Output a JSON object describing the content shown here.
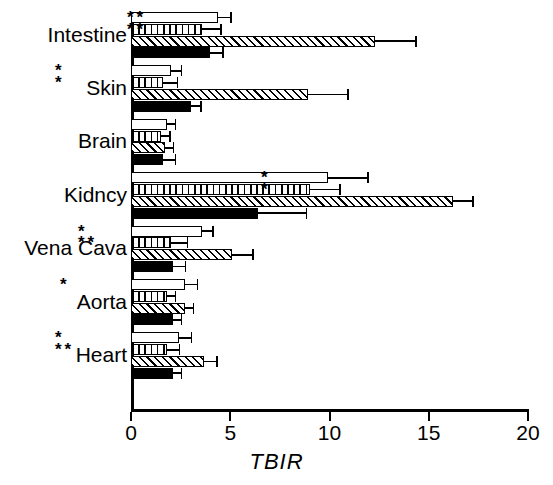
{
  "chart_data": {
    "type": "bar",
    "orientation": "horizontal",
    "title": "",
    "xlabel": "TBIR",
    "ylabel": "",
    "xlim": [
      0,
      20
    ],
    "xticks": [
      0,
      5,
      10,
      15,
      20
    ],
    "xticklabels": [
      "0",
      "5",
      "10",
      "15",
      "20"
    ],
    "grid": false,
    "legend": "none",
    "categories": [
      "Intestine",
      "Skin",
      "Brain",
      "Kidncy",
      "Vena Cava",
      "Aorta",
      "Heart"
    ],
    "series": [
      {
        "name": "open",
        "fill": "white",
        "values": [
          4.4,
          2.0,
          1.8,
          9.9,
          3.6,
          2.7,
          2.4
        ],
        "errors": [
          0.6,
          0.5,
          0.4,
          2.0,
          0.5,
          0.6,
          0.6
        ],
        "significance": [
          "",
          "*",
          "",
          "*",
          "*",
          "*",
          "*"
        ]
      },
      {
        "name": "vertical-striped",
        "fill": "vertical-stripes",
        "values": [
          3.6,
          1.6,
          1.5,
          9.0,
          2.0,
          1.8,
          1.8
        ],
        "errors": [
          0.9,
          0.7,
          0.4,
          1.5,
          0.8,
          0.4,
          0.6
        ],
        "significance": [
          "",
          "",
          "",
          "",
          "",
          "",
          ""
        ]
      },
      {
        "name": "diagonal-hatched",
        "fill": "diagonal-hatch",
        "values": [
          12.3,
          8.9,
          1.7,
          16.2,
          5.1,
          2.7,
          3.7
        ],
        "errors": [
          2.0,
          2.0,
          0.4,
          1.0,
          1.0,
          0.4,
          0.6
        ],
        "significance": [
          "**",
          "*",
          "",
          "*",
          "**",
          "",
          "**"
        ]
      },
      {
        "name": "solid-black",
        "fill": "black",
        "values": [
          4.0,
          3.0,
          1.6,
          6.4,
          2.1,
          2.1,
          2.1
        ],
        "errors": [
          0.6,
          0.5,
          0.6,
          2.4,
          0.6,
          0.4,
          0.4
        ],
        "significance": [
          "",
          "",
          "",
          "",
          "",
          "",
          ""
        ]
      }
    ],
    "annotations": [
      {
        "label": "**",
        "category": "Intestine",
        "row": 0
      },
      {
        "label": "**",
        "category": "Intestine",
        "row": 1
      },
      {
        "label": "*",
        "category": "Skin",
        "row": 0
      },
      {
        "label": "*",
        "category": "Skin",
        "row": 1
      },
      {
        "label": "*",
        "category": "Kidncy",
        "row": 0
      },
      {
        "label": "*",
        "category": "Kidncy",
        "row": 1
      },
      {
        "label": "*",
        "category": "Vena Cava",
        "row": 0
      },
      {
        "label": "**",
        "category": "Vena Cava",
        "row": 1
      },
      {
        "label": "*",
        "category": "Aorta",
        "row": 0
      },
      {
        "label": "*",
        "category": "Heart",
        "row": 0
      },
      {
        "label": "**",
        "category": "Heart",
        "row": 1
      }
    ]
  },
  "axis": {
    "x_title": "TBIR",
    "tick_0": "0",
    "tick_5": "5",
    "tick_10": "10",
    "tick_15": "15",
    "tick_20": "20"
  },
  "categories": {
    "intestine": "Intestine",
    "skin": "Skin",
    "brain": "Brain",
    "kidncy": "Kidncy",
    "vena_cava": "Vena Cava",
    "aorta": "Aorta",
    "heart": "Heart"
  }
}
